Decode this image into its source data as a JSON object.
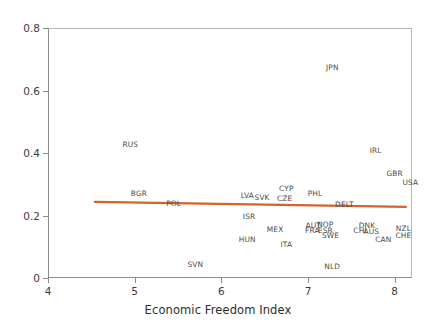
{
  "chart_data": {
    "type": "scatter",
    "title": "",
    "xlabel": "Economic Freedom Index",
    "ylabel": "",
    "xlim": [
      4,
      8.2
    ],
    "ylim": [
      0,
      0.8
    ],
    "xticks": [
      "4",
      "5",
      "6",
      "7",
      "8"
    ],
    "xtick_values": [
      4,
      5,
      6,
      7,
      8
    ],
    "yticks": [
      "0",
      "0.2",
      "0.4",
      "0.6",
      "0.8"
    ],
    "ytick_values": [
      0,
      0.2,
      0.4,
      0.6,
      0.8
    ],
    "grid": false,
    "legend": "none",
    "marker_style": "text-label-only",
    "points": [
      {
        "label": "RUS",
        "x": 4.95,
        "y": 0.425
      },
      {
        "label": "BGR",
        "x": 5.05,
        "y": 0.268
      },
      {
        "label": "POL",
        "x": 5.45,
        "y": 0.238
      },
      {
        "label": "LVA",
        "x": 6.3,
        "y": 0.262
      },
      {
        "label": "SVK",
        "x": 6.47,
        "y": 0.255
      },
      {
        "label": "CYP",
        "x": 6.75,
        "y": 0.285
      },
      {
        "label": "CZE",
        "x": 6.73,
        "y": 0.252
      },
      {
        "label": "ISR",
        "x": 6.32,
        "y": 0.196
      },
      {
        "label": "PHL",
        "x": 7.08,
        "y": 0.268
      },
      {
        "label": "DELT",
        "x": 7.42,
        "y": 0.234
      },
      {
        "label": "IRL",
        "x": 7.78,
        "y": 0.405
      },
      {
        "label": "GBR",
        "x": 8.0,
        "y": 0.333
      },
      {
        "label": "USA",
        "x": 8.18,
        "y": 0.305
      },
      {
        "label": "JPN",
        "x": 7.28,
        "y": 0.672
      },
      {
        "label": "AUT",
        "x": 7.06,
        "y": 0.168
      },
      {
        "label": "NOP",
        "x": 7.2,
        "y": 0.17
      },
      {
        "label": "FRA",
        "x": 7.05,
        "y": 0.152
      },
      {
        "label": "ESR",
        "x": 7.2,
        "y": 0.152
      },
      {
        "label": "SWE",
        "x": 7.26,
        "y": 0.135
      },
      {
        "label": "DNK",
        "x": 7.68,
        "y": 0.168
      },
      {
        "label": "CHI",
        "x": 7.6,
        "y": 0.15
      },
      {
        "label": "AUS",
        "x": 7.73,
        "y": 0.146
      },
      {
        "label": "CAN",
        "x": 7.87,
        "y": 0.122
      },
      {
        "label": "NZL",
        "x": 8.1,
        "y": 0.157
      },
      {
        "label": "CHE",
        "x": 8.1,
        "y": 0.136
      },
      {
        "label": "MEX",
        "x": 6.62,
        "y": 0.153
      },
      {
        "label": "HUN",
        "x": 6.3,
        "y": 0.122
      },
      {
        "label": "ITA",
        "x": 6.75,
        "y": 0.105
      },
      {
        "label": "SVN",
        "x": 5.7,
        "y": 0.042
      },
      {
        "label": "NLD",
        "x": 7.28,
        "y": 0.035
      }
    ],
    "trend_line": {
      "label": "linear-fit",
      "color": "#d4622a",
      "x_start": 4.54,
      "y_start": 0.2435,
      "x_end": 8.13,
      "y_end": 0.2275
    },
    "colors": {
      "label_text": "#4a4a4a",
      "axis": "#8c8c8c",
      "tick_text": "#3c3c3c",
      "trend": "#d4622a",
      "background": "#ffffff"
    }
  }
}
